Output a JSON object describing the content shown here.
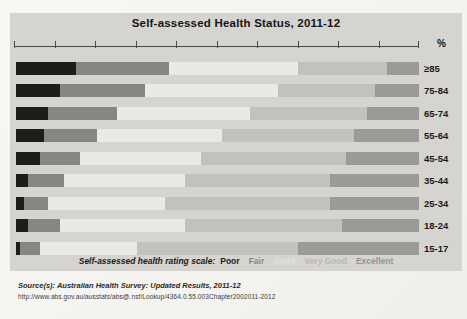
{
  "title": "Self-assessed Health Status, 2011-12",
  "axis": {
    "unit_label": "%",
    "min": 0,
    "max": 100,
    "tick_step": 10
  },
  "chart_data": {
    "type": "bar",
    "stacked": true,
    "orientation": "horizontal",
    "unit": "percent",
    "title": "Self-assessed Health Status, 2011-12",
    "xlabel": "%",
    "xlim": [
      0,
      100
    ],
    "grid": false,
    "legend_position": "bottom",
    "categories": [
      "≥85",
      "75-84",
      "65-74",
      "55-64",
      "45-54",
      "35-44",
      "25-34",
      "18-24",
      "15-17"
    ],
    "series": [
      {
        "name": "Poor",
        "color": "#1e1d1b",
        "values": [
          15,
          11,
          8,
          7,
          6,
          3,
          2,
          3,
          1
        ]
      },
      {
        "name": "Fair",
        "color": "#878683",
        "values": [
          23,
          21,
          17,
          13,
          10,
          9,
          6,
          8,
          5
        ]
      },
      {
        "name": "Good",
        "color": "#eae9e5",
        "values": [
          32,
          33,
          33,
          31,
          30,
          30,
          29,
          31,
          24
        ]
      },
      {
        "name": "Very Good",
        "color": "#c2c1bd",
        "values": [
          22,
          24,
          29,
          33,
          36,
          36,
          41,
          39,
          40
        ]
      },
      {
        "name": "Excellent",
        "color": "#9b9a97",
        "values": [
          8,
          11,
          13,
          16,
          18,
          22,
          22,
          19,
          30
        ]
      }
    ]
  },
  "legend": {
    "prefix": "Self-assessed health rating scale:",
    "items": [
      {
        "label": "Poor",
        "color": "#1e1d1b"
      },
      {
        "label": "Fair",
        "color": "#8a8986"
      },
      {
        "label": "Good",
        "color": "#e2e1dd"
      },
      {
        "label": "Very Good",
        "color": "#bab9b5"
      },
      {
        "label": "Excellent",
        "color": "#95948f"
      }
    ]
  },
  "footer": {
    "source": "Source(s): Australian Health Survey: Updated Results, 2011-12",
    "url": "http://www.abs.gov.au/ausstats/abs@.nsf/Lookup/4364.0.55.003Chapter2002011-2012"
  }
}
